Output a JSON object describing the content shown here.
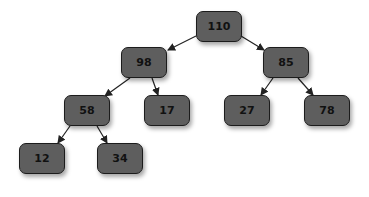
{
  "diagram": {
    "type": "binary-tree",
    "colors": {
      "node_fill": "#5e5e5e",
      "node_border": "#1c1c1c",
      "edge": "#222222",
      "text": "#111111"
    },
    "nodes": [
      {
        "id": "n110",
        "label": "110",
        "x": 196,
        "y": 11
      },
      {
        "id": "n98",
        "label": "98",
        "x": 121,
        "y": 47
      },
      {
        "id": "n85",
        "label": "85",
        "x": 263,
        "y": 47
      },
      {
        "id": "n58",
        "label": "58",
        "x": 64,
        "y": 95
      },
      {
        "id": "n17",
        "label": "17",
        "x": 144,
        "y": 95
      },
      {
        "id": "n27",
        "label": "27",
        "x": 224,
        "y": 95
      },
      {
        "id": "n78",
        "label": "78",
        "x": 304,
        "y": 95
      },
      {
        "id": "n12",
        "label": "12",
        "x": 19,
        "y": 143
      },
      {
        "id": "n34",
        "label": "34",
        "x": 97,
        "y": 143
      }
    ],
    "edges": [
      {
        "from": "110",
        "to": "98"
      },
      {
        "from": "110",
        "to": "85"
      },
      {
        "from": "98",
        "to": "58"
      },
      {
        "from": "98",
        "to": "17"
      },
      {
        "from": "85",
        "to": "27"
      },
      {
        "from": "85",
        "to": "78"
      },
      {
        "from": "58",
        "to": "12"
      },
      {
        "from": "58",
        "to": "34"
      }
    ]
  }
}
